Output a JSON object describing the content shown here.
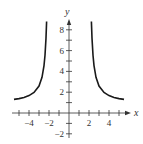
{
  "chart_data": {
    "type": "line",
    "title": "",
    "xlabel": "x",
    "ylabel": "y",
    "xlim": [
      -5.6,
      5.6
    ],
    "ylim": [
      -2.5,
      9.2
    ],
    "grid": false,
    "legend": null,
    "x_tick_labels": [
      "−4",
      "−2",
      "2",
      "4"
    ],
    "x_tick_values": [
      -4,
      -2,
      2,
      4
    ],
    "x_ticks": [
      -5,
      -4,
      -3,
      -2,
      -1,
      1,
      2,
      3,
      4,
      5
    ],
    "y_tick_labels": [
      "−2",
      "2",
      "4",
      "6",
      "8"
    ],
    "y_tick_values": [
      -2,
      2,
      4,
      6,
      8
    ],
    "y_ticks": [
      -2,
      -1,
      1,
      2,
      3,
      4,
      5,
      6,
      7,
      8
    ],
    "series": [
      {
        "name": "left branch",
        "x": [
          -5.5,
          -5.0,
          -4.5,
          -4.0,
          -3.5,
          -3.0,
          -2.7,
          -2.5,
          -2.4,
          -2.3,
          -2.24
        ],
        "y": [
          1.31,
          1.38,
          1.49,
          1.67,
          1.97,
          2.6,
          3.43,
          4.56,
          5.55,
          7.2,
          8.8
        ]
      },
      {
        "name": "right branch",
        "x": [
          2.24,
          2.3,
          2.4,
          2.5,
          2.7,
          3.0,
          3.5,
          4.0,
          4.5,
          5.0,
          5.5
        ],
        "y": [
          8.8,
          7.2,
          5.55,
          4.56,
          3.43,
          2.6,
          1.97,
          1.67,
          1.49,
          1.38,
          1.31
        ]
      }
    ],
    "vertical_asymptotes": [
      -2,
      2
    ]
  },
  "colors": {
    "curve": "#1a1a1a",
    "axis": "#333333",
    "background": "#ffffff"
  }
}
